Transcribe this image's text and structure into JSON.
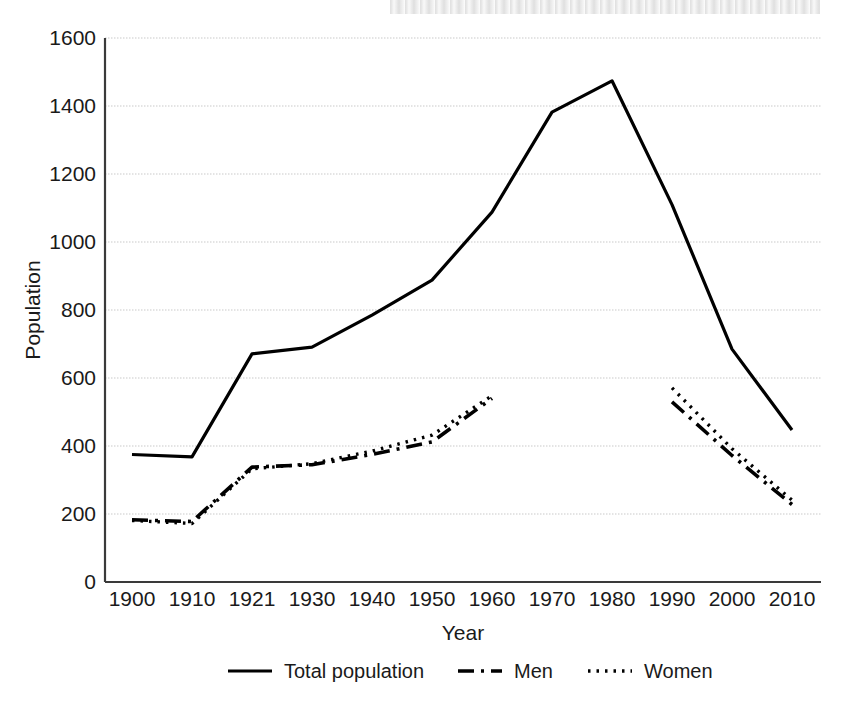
{
  "chart_data": {
    "type": "line",
    "title": "",
    "xlabel": "Year",
    "ylabel": "Population",
    "categories": [
      "1900",
      "1910",
      "1921",
      "1930",
      "1940",
      "1950",
      "1960",
      "1970",
      "1980",
      "1990",
      "2000",
      "2010"
    ],
    "xticklabels": [
      "1900",
      "1910",
      "1921",
      "1930",
      "1940",
      "1950",
      "1960",
      "1970",
      "1980",
      "1990",
      "2000",
      "2010"
    ],
    "yticklabels": [
      "0",
      "200",
      "400",
      "600",
      "800",
      "1000",
      "1200",
      "1400",
      "1600"
    ],
    "ytickvalues": [
      0,
      200,
      400,
      600,
      800,
      1000,
      1200,
      1400,
      1600
    ],
    "ylim": [
      0,
      1600
    ],
    "grid": "horizontal",
    "legend_position": "bottom",
    "series": [
      {
        "name": "Total population",
        "style": "solid",
        "color": "#000000",
        "values": [
          375,
          368,
          671,
          691,
          785,
          888,
          1088,
          1382,
          1474,
          1110,
          685,
          447
        ]
      },
      {
        "name": "Men",
        "style": "dashed",
        "color": "#000000",
        "values": [
          183,
          178,
          338,
          345,
          375,
          412,
          540,
          null,
          null,
          530,
          372,
          228
        ]
      },
      {
        "name": "Women",
        "style": "dotted",
        "color": "#000000",
        "values": [
          181,
          172,
          333,
          348,
          385,
          432,
          548,
          null,
          null,
          571,
          392,
          241
        ]
      }
    ]
  },
  "legend": {
    "entries": [
      {
        "label": "Total population",
        "style": "solid"
      },
      {
        "label": "Men",
        "style": "dashed"
      },
      {
        "label": "Women",
        "style": "dotted"
      }
    ]
  }
}
